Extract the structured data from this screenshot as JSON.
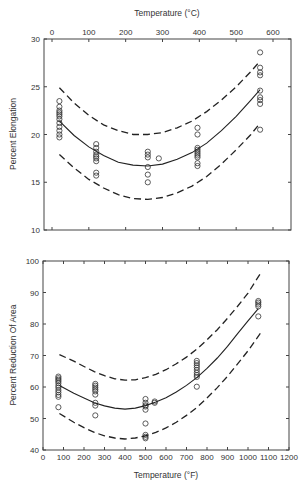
{
  "chart_data": [
    {
      "type": "scatter",
      "title": "",
      "xlabel": "Temperature (°C)",
      "ylabel": "Percent Elongation",
      "xlim": [
        0,
        600
      ],
      "ylim": [
        10,
        30
      ],
      "xticks": [
        0,
        100,
        200,
        300,
        400,
        500,
        600
      ],
      "yticks": [
        10,
        15,
        20,
        25,
        30
      ],
      "x_axis_position": "top",
      "grid": false,
      "legend": null,
      "series": [
        {
          "name": "Data",
          "kind": "scatter",
          "marker": "open-circle",
          "points": [
            [
              20,
              23.5
            ],
            [
              20,
              22.9
            ],
            [
              20,
              22.5
            ],
            [
              20,
              22.3
            ],
            [
              20,
              22.1
            ],
            [
              20,
              21.9
            ],
            [
              20,
              21.6
            ],
            [
              20,
              21.2
            ],
            [
              20,
              20.8
            ],
            [
              20,
              20.4
            ],
            [
              20,
              20.0
            ],
            [
              20,
              19.7
            ],
            [
              120,
              19.0
            ],
            [
              120,
              18.6
            ],
            [
              120,
              18.2
            ],
            [
              120,
              17.9
            ],
            [
              120,
              17.7
            ],
            [
              120,
              17.5
            ],
            [
              120,
              17.2
            ],
            [
              120,
              16.0
            ],
            [
              120,
              15.7
            ],
            [
              260,
              18.2
            ],
            [
              260,
              17.9
            ],
            [
              260,
              17.6
            ],
            [
              260,
              16.6
            ],
            [
              260,
              15.8
            ],
            [
              260,
              15.0
            ],
            [
              290,
              17.5
            ],
            [
              395,
              20.7
            ],
            [
              395,
              20.0
            ],
            [
              395,
              18.6
            ],
            [
              395,
              18.4
            ],
            [
              395,
              18.2
            ],
            [
              395,
              18.0
            ],
            [
              395,
              17.8
            ],
            [
              395,
              17.6
            ],
            [
              395,
              17.0
            ],
            [
              395,
              16.7
            ],
            [
              565,
              28.6
            ],
            [
              565,
              27.0
            ],
            [
              565,
              26.5
            ],
            [
              565,
              26.2
            ],
            [
              565,
              24.6
            ],
            [
              565,
              23.9
            ],
            [
              565,
              23.6
            ],
            [
              565,
              23.2
            ],
            [
              565,
              20.5
            ]
          ]
        },
        {
          "name": "Fit",
          "kind": "line",
          "style": "solid",
          "x": [
            20,
            60,
            100,
            140,
            180,
            220,
            260,
            300,
            340,
            380,
            420,
            460,
            500,
            540,
            565
          ],
          "y": [
            21.4,
            19.9,
            18.7,
            17.8,
            17.1,
            16.8,
            16.7,
            16.9,
            17.4,
            18.1,
            19.1,
            20.4,
            21.9,
            23.6,
            24.7
          ]
        },
        {
          "name": "Upper bound",
          "kind": "line",
          "style": "dashed",
          "x": [
            20,
            60,
            100,
            140,
            180,
            220,
            260,
            300,
            340,
            380,
            420,
            460,
            500,
            540,
            565
          ],
          "y": [
            24.9,
            23.3,
            22.0,
            21.0,
            20.4,
            20.0,
            20.0,
            20.2,
            20.7,
            21.4,
            22.4,
            23.6,
            25.0,
            26.6,
            27.7
          ]
        },
        {
          "name": "Lower bound",
          "kind": "line",
          "style": "dashed",
          "x": [
            20,
            60,
            100,
            140,
            180,
            220,
            260,
            300,
            340,
            380,
            420,
            460,
            500,
            540,
            565
          ],
          "y": [
            17.9,
            16.5,
            15.3,
            14.4,
            13.7,
            13.3,
            13.2,
            13.4,
            13.9,
            14.6,
            15.6,
            16.9,
            18.4,
            20.0,
            21.2
          ]
        }
      ]
    },
    {
      "type": "scatter",
      "title": "",
      "xlabel": "Temperature (°F)",
      "ylabel": "Percent Reduction Of Area",
      "xlim": [
        0,
        1200
      ],
      "ylim": [
        40,
        100
      ],
      "xticks": [
        0,
        100,
        200,
        300,
        400,
        500,
        600,
        700,
        800,
        900,
        1000,
        1100,
        1200
      ],
      "yticks": [
        40,
        50,
        60,
        70,
        80,
        90,
        100
      ],
      "x_axis_position": "bottom",
      "grid": false,
      "legend": null,
      "series": [
        {
          "name": "Data",
          "kind": "scatter",
          "marker": "open-circle",
          "points": [
            [
              75,
              63.3
            ],
            [
              75,
              62.8
            ],
            [
              75,
              62.3
            ],
            [
              75,
              61.8
            ],
            [
              75,
              61.2
            ],
            [
              75,
              60.4
            ],
            [
              75,
              59.8
            ],
            [
              75,
              59.0
            ],
            [
              75,
              58.3
            ],
            [
              75,
              57.5
            ],
            [
              75,
              56.9
            ],
            [
              75,
              53.6
            ],
            [
              255,
              61.0
            ],
            [
              255,
              60.4
            ],
            [
              255,
              59.8
            ],
            [
              255,
              59.2
            ],
            [
              255,
              58.6
            ],
            [
              255,
              57.6
            ],
            [
              255,
              55.0
            ],
            [
              255,
              54.1
            ],
            [
              255,
              51.0
            ],
            [
              500,
              56.2
            ],
            [
              500,
              55.0
            ],
            [
              500,
              54.2
            ],
            [
              500,
              53.8
            ],
            [
              500,
              52.8
            ],
            [
              500,
              48.4
            ],
            [
              500,
              44.8
            ],
            [
              500,
              44.2
            ],
            [
              500,
              43.7
            ],
            [
              545,
              55.4
            ],
            [
              545,
              55.0
            ],
            [
              750,
              68.3
            ],
            [
              750,
              67.6
            ],
            [
              750,
              66.9
            ],
            [
              750,
              66.2
            ],
            [
              750,
              65.4
            ],
            [
              750,
              64.5
            ],
            [
              750,
              63.8
            ],
            [
              750,
              63.2
            ],
            [
              750,
              60.1
            ],
            [
              1050,
              87.3
            ],
            [
              1050,
              86.8
            ],
            [
              1050,
              86.2
            ],
            [
              1050,
              85.6
            ],
            [
              1050,
              82.4
            ]
          ]
        },
        {
          "name": "Fit",
          "kind": "line",
          "style": "solid",
          "x": [
            80,
            150,
            200,
            250,
            300,
            350,
            400,
            450,
            500,
            550,
            600,
            650,
            700,
            750,
            800,
            850,
            900,
            950,
            1000,
            1050
          ],
          "y": [
            60.5,
            58.0,
            56.5,
            55.0,
            54.0,
            53.3,
            53.0,
            53.3,
            54.1,
            55.2,
            56.6,
            58.4,
            60.5,
            63.0,
            65.9,
            69.2,
            72.9,
            77.0,
            81.0,
            84.9
          ]
        },
        {
          "name": "Upper bound",
          "kind": "line",
          "style": "dashed",
          "x": [
            80,
            150,
            200,
            250,
            300,
            350,
            400,
            450,
            500,
            550,
            600,
            650,
            700,
            750,
            800,
            850,
            900,
            950,
            1000,
            1060
          ],
          "y": [
            70.3,
            68.2,
            66.5,
            64.9,
            63.6,
            62.6,
            62.2,
            62.3,
            63.0,
            64.0,
            65.5,
            67.4,
            69.5,
            72.0,
            75.0,
            78.2,
            81.8,
            85.7,
            89.8,
            96.0
          ]
        },
        {
          "name": "Lower bound",
          "kind": "line",
          "style": "dashed",
          "x": [
            80,
            150,
            200,
            250,
            300,
            350,
            400,
            450,
            500,
            550,
            600,
            650,
            700,
            750,
            800,
            850,
            900,
            950,
            1000,
            1060
          ],
          "y": [
            51.6,
            48.8,
            47.1,
            45.6,
            44.5,
            43.8,
            43.5,
            43.8,
            44.5,
            45.6,
            47.0,
            48.8,
            51.0,
            53.5,
            56.5,
            59.8,
            63.4,
            67.4,
            71.5,
            77.0
          ]
        }
      ]
    }
  ],
  "layout": {
    "plots": [
      {
        "left": 44,
        "right": 291,
        "top": 39,
        "bottom": 230,
        "x_px_at_min": 52,
        "x_px_at_max": 273
      },
      {
        "left": 43,
        "right": 289,
        "top": 261,
        "bottom": 450,
        "x_px_at_min": 43,
        "x_px_at_max": 289
      }
    ]
  },
  "labels": {
    "top_xlabel": "Temperature (°C)",
    "top_ylabel": "Percent Elongation",
    "bottom_xlabel": "Temperature (°F)",
    "bottom_ylabel": "Percent Reduction Of Area"
  }
}
